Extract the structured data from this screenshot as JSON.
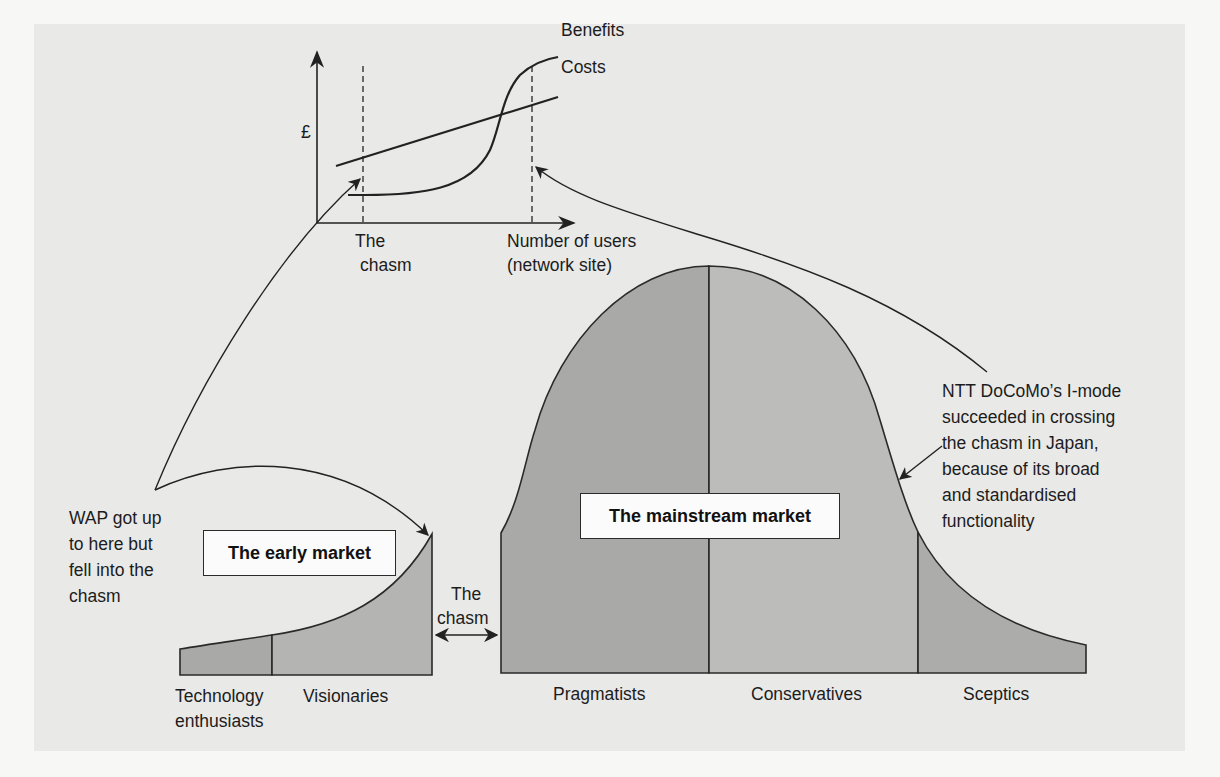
{
  "figure": {
    "top_chart": {
      "y_axis_label": "£",
      "x_axis_label_line1": "Number of users",
      "x_axis_label_line2": "(network site)",
      "chasm_label_line1": "The",
      "chasm_label_line2": "chasm",
      "series": [
        {
          "name": "Benefits",
          "shape": "S-curve"
        },
        {
          "name": "Costs",
          "shape": "linear"
        }
      ]
    },
    "early_market": {
      "box_label": "The early market",
      "segments": [
        "Technology enthusiasts",
        "Visionaries"
      ],
      "segment_labels": {
        "tech_line1": "Technology",
        "tech_line2": "enthusiasts",
        "visionaries": "Visionaries"
      }
    },
    "chasm_gap": {
      "line1": "The",
      "line2": "chasm"
    },
    "mainstream_market": {
      "box_label": "The mainstream market",
      "segments": [
        "Pragmatists",
        "Conservatives",
        "Sceptics"
      ]
    },
    "annotations": {
      "wap": [
        "WAP got up",
        "to here but",
        "fell into the",
        "chasm"
      ],
      "ntt": [
        "NTT DoCoMo’s I-mode",
        "succeeded in crossing",
        "the chasm in Japan,",
        "because of its broad",
        "and standardised",
        "functionality"
      ]
    },
    "colors": {
      "panel": "#e9e9e8",
      "fill_dark": "#a9a9a8",
      "fill_light": "#bcbcbb",
      "stroke": "#2a2a2a"
    }
  }
}
